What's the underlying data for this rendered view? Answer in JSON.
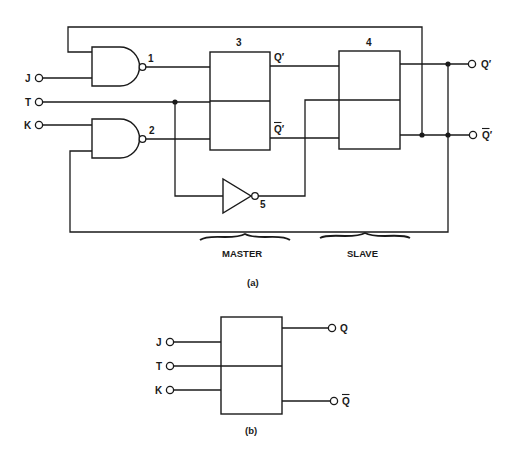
{
  "figure_a": {
    "caption": "(a)",
    "inputs": [
      {
        "label": "J"
      },
      {
        "label": "T"
      },
      {
        "label": "K"
      }
    ],
    "gates": [
      {
        "id": "1",
        "type": "nand"
      },
      {
        "id": "2",
        "type": "nand"
      },
      {
        "id": "5",
        "type": "inverter"
      }
    ],
    "blocks": [
      {
        "id": "3",
        "out_top": "Q′",
        "out_bottom": "Q′"
      },
      {
        "id": "4"
      }
    ],
    "outputs": [
      {
        "label": "Q′",
        "overbar": false
      },
      {
        "label": "Q′",
        "overbar": true
      }
    ],
    "sections": [
      {
        "label": "MASTER"
      },
      {
        "label": "SLAVE"
      }
    ]
  },
  "figure_b": {
    "caption": "(b)",
    "inputs": [
      {
        "label": "J"
      },
      {
        "label": "T"
      },
      {
        "label": "K"
      }
    ],
    "outputs": [
      {
        "label": "Q",
        "overbar": false
      },
      {
        "label": "Q",
        "overbar": true
      }
    ]
  },
  "colors": {
    "ink": "#1a1a1a",
    "background": "#ffffff"
  }
}
